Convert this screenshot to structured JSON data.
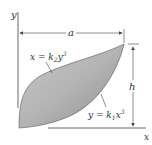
{
  "diagram": {
    "axes": {
      "x_label": "x",
      "y_label": "y"
    },
    "dimensions": {
      "width_label": "a",
      "height_label": "h"
    },
    "curves": {
      "upper": {
        "eq_lhs": "x = k",
        "sub": "2",
        "var": "y",
        "exp": "3"
      },
      "lower": {
        "eq_lhs": "y = k",
        "sub": "1",
        "var": "x",
        "exp": "3"
      }
    },
    "colors": {
      "fill_dark": "#9a9a9a",
      "fill_light": "#dcdcdc",
      "line": "#444444"
    }
  }
}
